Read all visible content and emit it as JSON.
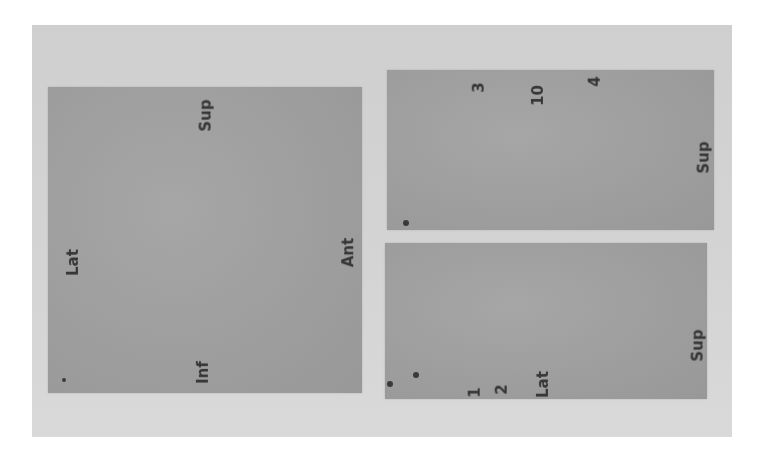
{
  "scene": {
    "description": "Grayscale photograph of three gray paper/card panels mounted on a light board, each annotated with handwritten orientation labels written sideways",
    "background_color": "#ffffff",
    "board_color": "#d2d2d2",
    "panel_color": "#a0a0a0",
    "ink_color": "#2b2b2b"
  },
  "panels": {
    "left": {
      "labels": {
        "top": "Sup",
        "left": "Lat",
        "right": "Ant",
        "bottom": "Inf"
      }
    },
    "right_top": {
      "labels": {
        "top_1": "3",
        "top_2": "10",
        "top_3": "4",
        "right": "Sup"
      }
    },
    "right_bottom": {
      "labels": {
        "bottom_1": "1",
        "bottom_2": "2",
        "bottom_3": "Lat",
        "right": "Sup"
      }
    }
  }
}
